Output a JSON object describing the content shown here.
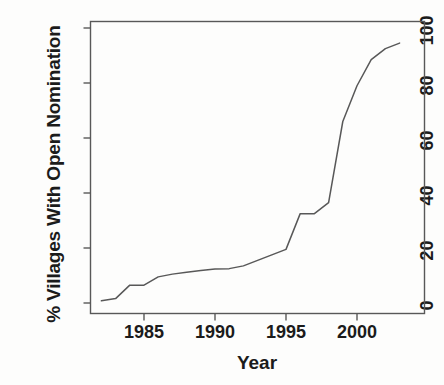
{
  "chart_data": {
    "type": "line",
    "title": "",
    "xlabel": "Year",
    "ylabel": "% Villages With Open Nomination",
    "xlim": [
      1981.5,
      2003.8
    ],
    "ylim": [
      0,
      103
    ],
    "grid": false,
    "legend": null,
    "xticks": [
      1985,
      1990,
      1995,
      2000
    ],
    "xtick_labels": [
      "1985",
      "1990",
      "1995",
      "2000"
    ],
    "yticks": [
      0,
      20,
      40,
      60,
      80,
      100
    ],
    "ytick_labels": [
      "0",
      "20",
      "40",
      "60",
      "80",
      "100"
    ],
    "series": [
      {
        "name": "% Villages With Open Nomination",
        "color": "#585858",
        "x": [
          1982,
          1983,
          1984,
          1985,
          1986,
          1987,
          1988,
          1989,
          1990,
          1991,
          1992,
          1993,
          1994,
          1995,
          1996,
          1997,
          1998,
          1999,
          2000,
          2001,
          2002,
          2003
        ],
        "values": [
          0.8,
          1.6,
          6.5,
          6.5,
          9.5,
          10.5,
          11.2,
          11.8,
          12.4,
          12.5,
          13.5,
          15.5,
          17.5,
          19.5,
          32.5,
          32.5,
          36.5,
          66.0,
          79.0,
          88.5,
          92.5,
          94.5
        ]
      }
    ],
    "annotations": []
  },
  "axes": {
    "line_color": "#585858",
    "text_color": "#1b1b1b",
    "background": "#fdfdfc"
  }
}
